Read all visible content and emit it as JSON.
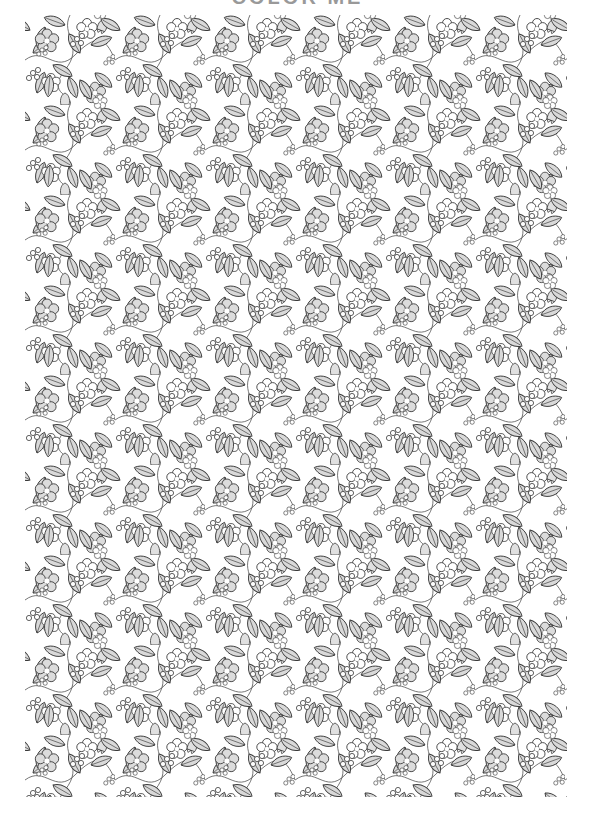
{
  "page": {
    "title": "COLOR ME",
    "type": "floral coloring page"
  },
  "pattern": {
    "motifs": [
      "five-petal-flower",
      "leaf-sprig",
      "berry-cluster",
      "bell-flower",
      "vine"
    ],
    "stroke_color": "#3a3a3a",
    "fill_color": "#d9d9d9",
    "background": "#ffffff"
  }
}
